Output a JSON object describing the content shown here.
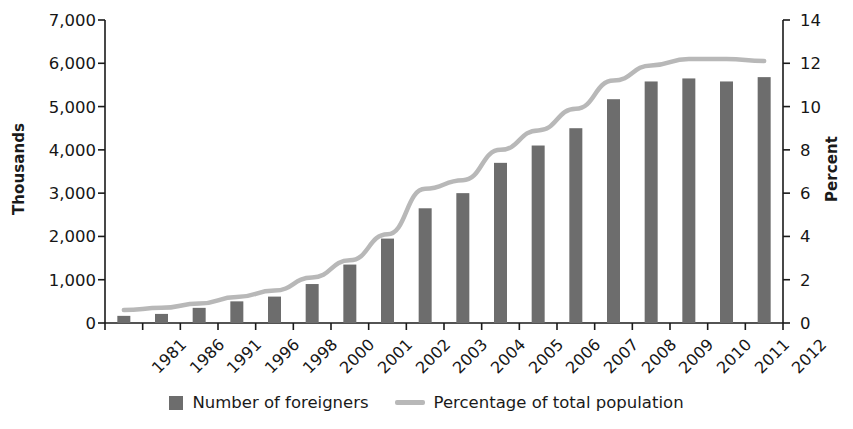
{
  "chart_data": {
    "type": "bar",
    "title": "",
    "subtitle": "",
    "xlabel": "",
    "ylabel": "Thousands",
    "y2label": "Percent",
    "categories": [
      "1981",
      "1986",
      "1991",
      "1996",
      "1998",
      "2000",
      "2001",
      "2002",
      "2003",
      "2004",
      "2005",
      "2006",
      "2007",
      "2008",
      "2009",
      "2010",
      "2011",
      "2012"
    ],
    "ylim": [
      0,
      7000
    ],
    "y2lim": [
      0,
      14
    ],
    "yticks": [
      "0",
      "1,000",
      "2,000",
      "3,000",
      "4,000",
      "5,000",
      "6,000",
      "7,000"
    ],
    "ytick_values": [
      0,
      1000,
      2000,
      3000,
      4000,
      5000,
      6000,
      7000
    ],
    "y2ticks": [
      "0",
      "2",
      "4",
      "6",
      "8",
      "10",
      "12",
      "14"
    ],
    "y2tick_values": [
      0,
      2,
      4,
      6,
      8,
      10,
      12,
      14
    ],
    "grid": false,
    "legend_position": "bottom",
    "series": [
      {
        "name": "Number of foreigners",
        "type": "bar",
        "axis": "left",
        "color": "#6d6d6d",
        "values": [
          165,
          210,
          350,
          500,
          610,
          900,
          1350,
          1950,
          2650,
          3000,
          3700,
          4100,
          4500,
          5170,
          5580,
          5650,
          5580,
          5680
        ]
      },
      {
        "name": "Percentage of total population",
        "type": "line",
        "axis": "right",
        "color": "#b8b8b8",
        "values": [
          0.6,
          0.7,
          0.9,
          1.2,
          1.5,
          2.1,
          2.9,
          4.1,
          6.2,
          6.6,
          8.0,
          8.9,
          9.9,
          11.2,
          11.9,
          12.2,
          12.2,
          12.1
        ]
      }
    ]
  },
  "legend": {
    "items": [
      {
        "label": "Number of foreigners",
        "marker": "bar-swatch",
        "color": "#6d6d6d"
      },
      {
        "label": "Percentage of total population",
        "marker": "line-swatch",
        "color": "#b8b8b8"
      }
    ]
  },
  "colors": {
    "bar": "#6d6d6d",
    "line": "#b8b8b8",
    "axis": "#1a1a1a",
    "text": "#161616",
    "background": "#ffffff"
  }
}
